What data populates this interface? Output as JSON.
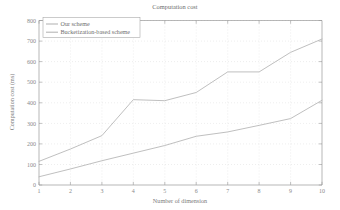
{
  "chart_data": {
    "type": "line",
    "title": "Computation cost",
    "xlabel": "Number of dimension",
    "ylabel": "Computation cost (ms)",
    "x": [
      1,
      2,
      3,
      4,
      5,
      6,
      7,
      8,
      9,
      10
    ],
    "xlim": [
      1,
      10
    ],
    "ylim": [
      0,
      800
    ],
    "xticks": [
      "1",
      "2",
      "3",
      "4",
      "5",
      "6",
      "7",
      "8",
      "9",
      "10"
    ],
    "yticks": [
      "0",
      "100",
      "200",
      "300",
      "400",
      "500",
      "600",
      "700",
      "800"
    ],
    "grid": true,
    "legend_position": "upper left",
    "series": [
      {
        "name": "Our scheme",
        "color": "#b4b4b4",
        "values": [
          40,
          78,
          118,
          155,
          192,
          237,
          258,
          290,
          323,
          412
        ]
      },
      {
        "name": "Bucketization-based scheme",
        "color": "#b4b4b4",
        "values": [
          115,
          175,
          240,
          415,
          410,
          450,
          550,
          550,
          645,
          710
        ]
      }
    ]
  },
  "legend": {
    "items": [
      {
        "label": "Our scheme"
      },
      {
        "label": "Bucketization-based scheme"
      }
    ]
  }
}
